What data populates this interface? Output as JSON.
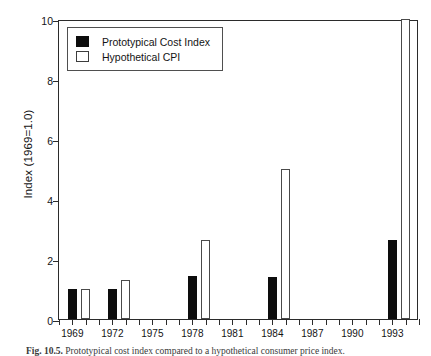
{
  "figure": {
    "caption_label": "Fig. 10.5.",
    "caption_text": "Prototypical cost index compared to a hypothetical consumer price index."
  },
  "legend": {
    "position": "top-left-inside",
    "entries": [
      {
        "label": "Prototypical Cost Index",
        "swatch": "black-filled-square",
        "color": "#0d0d0d"
      },
      {
        "label": "Hypothetical CPI",
        "swatch": "white-open-square",
        "color": "#ffffff"
      }
    ]
  },
  "chart_data": {
    "type": "bar",
    "title": "",
    "subtitle": "",
    "xlabel": "",
    "ylabel": "Index (1969=1.0)",
    "xlim": [
      1968,
      1995
    ],
    "ylim": [
      0,
      10
    ],
    "yticks": [
      0,
      2,
      4,
      6,
      8,
      10
    ],
    "ytick_labels": [
      "0",
      "2",
      "4",
      "6",
      "8",
      "10"
    ],
    "xticks": [
      1968,
      1969,
      1970,
      1971,
      1972,
      1973,
      1974,
      1975,
      1976,
      1977,
      1978,
      1979,
      1980,
      1981,
      1982,
      1983,
      1984,
      1985,
      1986,
      1987,
      1988,
      1989,
      1990,
      1991,
      1992,
      1993,
      1994,
      1995
    ],
    "xtick_labels_shown": [
      "1969",
      "1972",
      "1975",
      "1978",
      "1981",
      "1984",
      "1987",
      "1990",
      "1993"
    ],
    "xtick_labels_shown_years": [
      1969,
      1972,
      1975,
      1978,
      1981,
      1984,
      1987,
      1990,
      1993
    ],
    "grid": false,
    "categories": [
      "1969",
      "1972",
      "1978",
      "1984",
      "1993"
    ],
    "series": [
      {
        "name": "Prototypical Cost Index",
        "color": "#0d0d0d",
        "values": [
          1.0,
          1.0,
          1.45,
          1.4,
          2.65
        ],
        "years": [
          1969,
          1972,
          1978,
          1984,
          1993
        ]
      },
      {
        "name": "Hypothetical CPI",
        "color": "#ffffff",
        "values": [
          1.0,
          1.3,
          2.65,
          5.0,
          10.0
        ],
        "years": [
          1970,
          1973,
          1979,
          1985,
          1994
        ],
        "notes": [
          "",
          "",
          "",
          "",
          "clipped at top of axis"
        ]
      }
    ]
  }
}
